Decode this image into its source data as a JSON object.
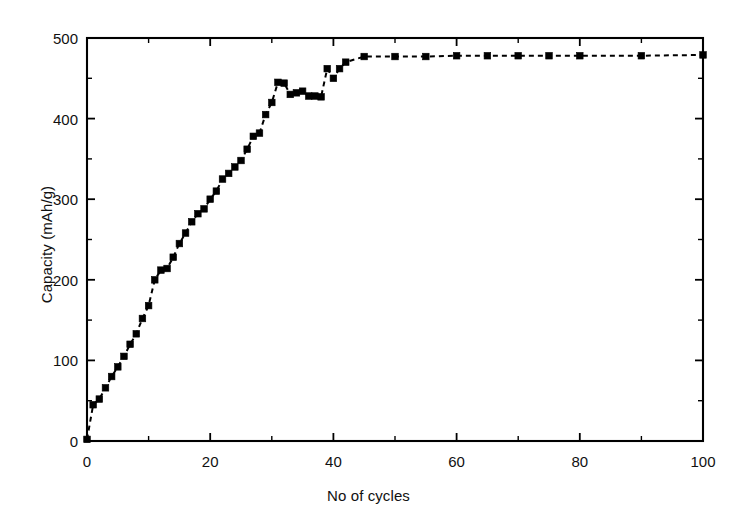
{
  "chart_data": {
    "type": "line",
    "title": "",
    "subtitle": "",
    "xlabel": "No of cycles",
    "ylabel": "Capacity (mAh/g)",
    "xlim": [
      0,
      100
    ],
    "ylim": [
      0,
      500
    ],
    "xticks": [
      0,
      20,
      40,
      60,
      80,
      100
    ],
    "yticks": [
      0,
      100,
      200,
      300,
      400,
      500
    ],
    "xtick_labels": [
      "0",
      "20",
      "40",
      "60",
      "80",
      "100"
    ],
    "ytick_labels": [
      "0",
      "100",
      "200",
      "300",
      "400",
      "500"
    ],
    "x_minor_step": 10,
    "y_minor_step": 50,
    "grid": false,
    "legend": null,
    "legend_position": "none",
    "line_style": "dashed",
    "line_color": "#000000",
    "marker": "square-filled",
    "marker_color": "#000000",
    "background_color": "#ffffff",
    "frame": "box",
    "series": [
      {
        "name": "Capacity",
        "x": [
          0,
          1,
          2,
          3,
          4,
          5,
          6,
          7,
          8,
          9,
          10,
          11,
          12,
          13,
          14,
          15,
          16,
          17,
          18,
          19,
          20,
          21,
          22,
          23,
          24,
          25,
          26,
          27,
          28,
          29,
          30,
          31,
          32,
          33,
          34,
          35,
          36,
          37,
          38,
          39,
          40,
          41,
          42,
          45,
          50,
          55,
          60,
          65,
          70,
          75,
          80,
          90,
          100
        ],
        "y": [
          2,
          45,
          52,
          66,
          80,
          92,
          105,
          120,
          133,
          152,
          168,
          200,
          212,
          214,
          228,
          245,
          258,
          272,
          282,
          288,
          300,
          310,
          325,
          332,
          340,
          348,
          362,
          378,
          382,
          405,
          420,
          445,
          444,
          430,
          432,
          434,
          428,
          428,
          427,
          462,
          450,
          462,
          470,
          477,
          477,
          477,
          478,
          478,
          478,
          478,
          478,
          478,
          479
        ]
      }
    ]
  },
  "axis_labels": {
    "x": "No of cycles",
    "y": "Capacity (mAh/g)"
  }
}
